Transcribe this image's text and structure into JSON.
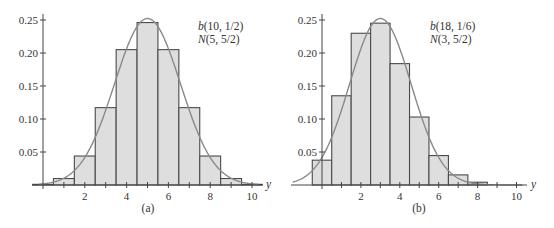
{
  "chart_data": [
    {
      "type": "bar",
      "subtype": "histogram-with-normal-curve",
      "caption": "(a)",
      "legend": [
        "b(10, 1/2)",
        "N(5, 5/2)"
      ],
      "legend_parts": [
        {
          "italic": "b",
          "rest": "(10, 1/2)"
        },
        {
          "italic": "N",
          "rest": "(5, 5/2)"
        }
      ],
      "legend_position": "top-right",
      "xlabel": "y",
      "ylabel": "",
      "xlim": [
        -0.5,
        10.5
      ],
      "ylim": [
        0,
        0.25
      ],
      "xticks": [
        2,
        4,
        6,
        8,
        10
      ],
      "xticks_minor": [
        1,
        3,
        5,
        7,
        9
      ],
      "yticks": [
        0.05,
        0.1,
        0.15,
        0.2,
        0.25
      ],
      "ytick_labels": [
        "0.05",
        "0.10",
        "0.15",
        "0.20",
        "0.25"
      ],
      "categories": [
        0,
        1,
        2,
        3,
        4,
        5,
        6,
        7,
        8,
        9,
        10
      ],
      "values": [
        0.001,
        0.0098,
        0.0439,
        0.1172,
        0.2051,
        0.2461,
        0.2051,
        0.1172,
        0.0439,
        0.0098,
        0.001
      ],
      "normal_curve": {
        "mean": 5,
        "variance": 2.5,
        "xrange": [
          0,
          10
        ]
      },
      "grid": false
    },
    {
      "type": "bar",
      "subtype": "histogram-with-normal-curve",
      "caption": "(b)",
      "legend": [
        "b(18, 1/6)",
        "N(3, 5/2)"
      ],
      "legend_parts": [
        {
          "italic": "b",
          "rest": "(18, 1/6)"
        },
        {
          "italic": "N",
          "rest": "(3, 5/2)"
        }
      ],
      "legend_position": "top-right",
      "xlabel": "y",
      "ylabel": "",
      "xlim": [
        -1.5,
        10.5
      ],
      "ylim": [
        0,
        0.25
      ],
      "xticks": [
        2,
        4,
        6,
        8,
        10
      ],
      "xticks_minor": [
        1,
        3,
        5,
        7,
        9
      ],
      "yticks": [
        0.05,
        0.1,
        0.15,
        0.2,
        0.25
      ],
      "ytick_labels": [
        "0.05",
        "0.10",
        "0.15",
        "0.20",
        "0.25"
      ],
      "categories": [
        0,
        1,
        2,
        3,
        4,
        5,
        6,
        7,
        8,
        9,
        10
      ],
      "values": [
        0.0376,
        0.1352,
        0.2299,
        0.2452,
        0.1839,
        0.103,
        0.0446,
        0.0153,
        0.0042,
        0.0009,
        0.0002
      ],
      "normal_curve": {
        "mean": 3,
        "variance": 2.5,
        "xrange": [
          -1.5,
          10
        ]
      },
      "grid": false
    }
  ]
}
